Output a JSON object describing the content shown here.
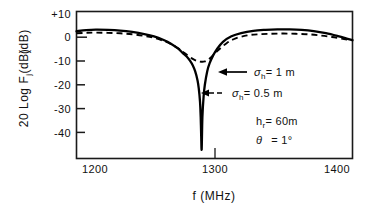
{
  "chart_data": {
    "type": "line",
    "title": "",
    "xlabel": "f (MHz)",
    "ylabel": "20 Log F",
    "ylabel_sub": "j",
    "ylabel_units": "(dB)",
    "xlim": [
      1184,
      1412
    ],
    "ylim": [
      -51,
      13
    ],
    "xticks": [
      1200,
      1300,
      1400
    ],
    "xtick_labels": [
      "1200",
      "1300",
      "1400"
    ],
    "yticks": [
      10,
      0,
      -10,
      -20,
      -30,
      -40
    ],
    "ytick_labels": [
      "+10",
      "0",
      "-10",
      "-20",
      "-30",
      "-40"
    ],
    "grid": false,
    "legend_position": "inside-right",
    "series": [
      {
        "name": "sigma_h = 1 m",
        "style": "solid",
        "color": "#000000",
        "x": [
          1184,
          1192,
          1200,
          1210,
          1220,
          1230,
          1240,
          1248,
          1256,
          1262,
          1268,
          1272,
          1275,
          1278,
          1280,
          1282,
          1284,
          1285,
          1286,
          1286.6,
          1287,
          1287.4,
          1288,
          1289,
          1290,
          1292,
          1294,
          1297,
          1300,
          1305,
          1312,
          1320,
          1330,
          1340,
          1350,
          1360,
          1370,
          1380,
          1390,
          1400,
          1408,
          1412
        ],
        "y": [
          4.4,
          4.9,
          5.1,
          5.0,
          4.7,
          4.1,
          3.2,
          2.2,
          0.6,
          -1.0,
          -3.2,
          -5.2,
          -6.6,
          -8.6,
          -10.4,
          -13.0,
          -17.0,
          -20.5,
          -26.0,
          -33.0,
          -41.0,
          -47.0,
          -33.0,
          -24.0,
          -19.0,
          -13.0,
          -9.5,
          -6.0,
          -3.4,
          -0.2,
          2.2,
          3.6,
          4.6,
          5.0,
          5.2,
          5.2,
          5.0,
          4.5,
          3.6,
          2.3,
          1.1,
          0.5
        ]
      },
      {
        "name": "sigma_h = 0.5 m",
        "style": "dashed",
        "color": "#000000",
        "x": [
          1184,
          1192,
          1200,
          1210,
          1220,
          1230,
          1240,
          1248,
          1256,
          1262,
          1268,
          1272,
          1276,
          1280,
          1283,
          1286,
          1288,
          1290,
          1292,
          1295,
          1298,
          1302,
          1308,
          1315,
          1325,
          1335,
          1345,
          1355,
          1365,
          1375,
          1385,
          1395,
          1405,
          1412
        ],
        "y": [
          3.5,
          3.7,
          3.8,
          3.7,
          3.5,
          3.1,
          2.4,
          1.6,
          0.2,
          -1.2,
          -3.0,
          -4.6,
          -6.2,
          -7.6,
          -8.4,
          -8.8,
          -8.9,
          -8.7,
          -8.2,
          -7.0,
          -5.4,
          -3.4,
          -0.8,
          1.2,
          2.6,
          3.1,
          3.3,
          3.4,
          3.3,
          3.1,
          2.6,
          1.9,
          1.0,
          0.5
        ]
      }
    ],
    "annotations": [
      {
        "id": "sigma-1m",
        "symbol": "σ",
        "subscript": "h",
        "text": "= 1 m",
        "arrow": "solid",
        "target_x": 1300,
        "target_y": -10
      },
      {
        "id": "sigma-05m",
        "symbol": "σ",
        "subscript": "h",
        "text": "= 0.5 m",
        "arrow": "dashed",
        "target_x": 1292,
        "target_y": -18
      },
      {
        "id": "param-hr",
        "symbol": "h",
        "subscript": "r",
        "text": "= 60m"
      },
      {
        "id": "param-theta",
        "symbol": "θ",
        "subscript": "",
        "text": "= 1°"
      }
    ]
  },
  "figure": {
    "frame_color": "#1a1a1a",
    "background": "#ffffff"
  }
}
